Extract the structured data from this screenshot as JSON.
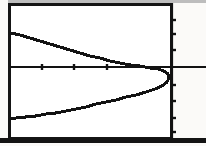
{
  "screen": {
    "kind": "graphing-calculator-screen",
    "width": 206,
    "height": 146,
    "background_color": "#ffffff",
    "ink_color": "#131313",
    "frame_color": "#151515"
  },
  "chart_data": {
    "type": "line",
    "title": "",
    "subtitle": "",
    "xlabel": "",
    "ylabel": "",
    "grid": false,
    "legend": "none",
    "curve_label": "sideways parabola opening left",
    "axes": {
      "x_axis_pixel_y": 67,
      "y_axis_pixel_x": 172,
      "xlim": [
        -5,
        1
      ],
      "ylim": [
        -4,
        4
      ],
      "x_tick_values": [
        -4,
        -3,
        -2
      ],
      "y_tick_values": [
        3,
        2,
        1,
        -1,
        -2,
        -3
      ],
      "x_tick_pixels": [
        42,
        74,
        107
      ],
      "y_tick_pixels": [
        20,
        34,
        50,
        85,
        101,
        118,
        132
      ]
    },
    "vertex": {
      "x": 0,
      "y": -0.3,
      "pixel_x": 169,
      "pixel_y": 74
    },
    "points": [
      {
        "px": 11,
        "py": 33
      },
      {
        "px": 20,
        "py": 35
      },
      {
        "px": 30,
        "py": 38
      },
      {
        "px": 40,
        "py": 41
      },
      {
        "px": 50,
        "py": 44
      },
      {
        "px": 60,
        "py": 47
      },
      {
        "px": 70,
        "py": 50
      },
      {
        "px": 80,
        "py": 53
      },
      {
        "px": 90,
        "py": 56
      },
      {
        "px": 100,
        "py": 58
      },
      {
        "px": 110,
        "py": 61
      },
      {
        "px": 120,
        "py": 63
      },
      {
        "px": 130,
        "py": 65
      },
      {
        "px": 140,
        "py": 66
      },
      {
        "px": 150,
        "py": 68
      },
      {
        "px": 158,
        "py": 69
      },
      {
        "px": 164,
        "py": 71
      },
      {
        "px": 168,
        "py": 74
      },
      {
        "px": 169,
        "py": 78
      },
      {
        "px": 167,
        "py": 82
      },
      {
        "px": 162,
        "py": 86
      },
      {
        "px": 155,
        "py": 89
      },
      {
        "px": 146,
        "py": 92
      },
      {
        "px": 136,
        "py": 95
      },
      {
        "px": 126,
        "py": 97
      },
      {
        "px": 116,
        "py": 100
      },
      {
        "px": 106,
        "py": 102
      },
      {
        "px": 96,
        "py": 104
      },
      {
        "px": 86,
        "py": 107
      },
      {
        "px": 76,
        "py": 109
      },
      {
        "px": 66,
        "py": 111
      },
      {
        "px": 56,
        "py": 113
      },
      {
        "px": 46,
        "py": 114
      },
      {
        "px": 36,
        "py": 116
      },
      {
        "px": 26,
        "py": 117
      },
      {
        "px": 16,
        "py": 118
      },
      {
        "px": 11,
        "py": 119
      }
    ]
  }
}
